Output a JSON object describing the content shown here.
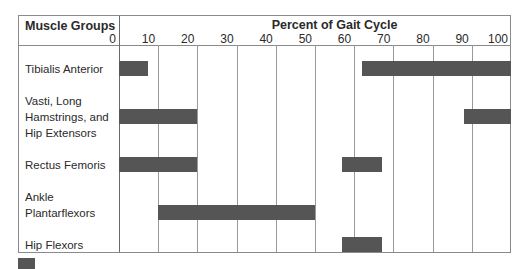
{
  "chart_data": {
    "type": "bar",
    "subtype": "gantt-timeline",
    "title": "Percent of Gait Cycle",
    "row_header": "Muscle Groups",
    "xlabel": "Percent of Gait Cycle",
    "ylabel": "Muscle Groups",
    "xlim": [
      0,
      100
    ],
    "x_ticks": [
      "0",
      "10",
      "20",
      "30",
      "40",
      "50",
      "60",
      "70",
      "80",
      "90",
      "100"
    ],
    "grid": true,
    "bar_color": "#555555",
    "categories": [
      "Tibialis Anterior",
      "Vasti, Long Hamstrings, and Hip Extensors",
      "Rectus Femoris",
      "Ankle Plantarflexors",
      "Hip Flexors"
    ],
    "series": [
      {
        "name": "Tibialis Anterior",
        "intervals": [
          [
            0,
            7.5
          ],
          [
            62,
            100
          ]
        ]
      },
      {
        "name": "Vasti, Long Hamstrings, and Hip Extensors",
        "intervals": [
          [
            0,
            20
          ],
          [
            88,
            100
          ]
        ]
      },
      {
        "name": "Rectus Femoris",
        "intervals": [
          [
            0,
            20
          ],
          [
            57,
            67
          ]
        ]
      },
      {
        "name": "Ankle Plantarflexors",
        "intervals": [
          [
            10,
            50
          ]
        ]
      },
      {
        "name": "Hip Flexors",
        "intervals": [
          [
            57,
            67
          ]
        ]
      }
    ],
    "legend": [
      {
        "swatch_color": "#555555",
        "label": ""
      }
    ]
  },
  "labels": {
    "row_header": "Muscle Groups",
    "axis_title": "Percent of Gait Cycle",
    "rows": [
      {
        "lines": [
          "Tibialis Anterior"
        ]
      },
      {
        "lines": [
          "Vasti, Long",
          "Hamstrings, and",
          "Hip Extensors"
        ]
      },
      {
        "lines": [
          "Rectus Femoris"
        ]
      },
      {
        "lines": [
          "Ankle",
          "Plantarflexors"
        ]
      },
      {
        "lines": [
          "Hip Flexors"
        ]
      }
    ]
  }
}
